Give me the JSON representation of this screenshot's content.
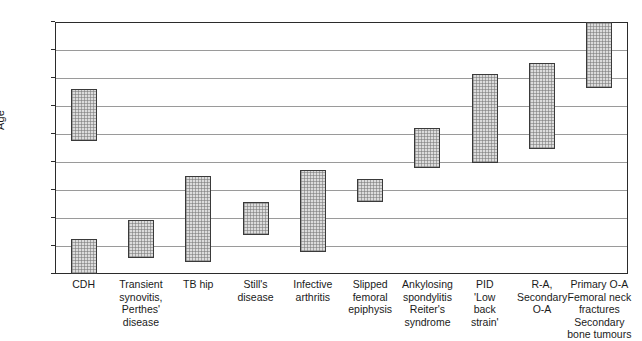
{
  "chart_data": {
    "type": "bar",
    "title": "",
    "xlabel": "",
    "ylabel": "Age",
    "ylim": [
      0,
      70
    ],
    "y_ticks": [
      0,
      5,
      10,
      15,
      20,
      30,
      40,
      50,
      60,
      70
    ],
    "grid": true,
    "legend": "none",
    "note": "Floating range bars showing typical age range of presentation for each hip condition. Y axis is non-linear: 0-20 uses 5-year steps, 20-70 uses 10-year steps, each step equal pixel height.",
    "categories": [
      "CDH",
      "Transient synovitis, Perthes' disease",
      "TB hip",
      "Still's disease",
      "Infective arthritis",
      "Slipped femoral epiphysis",
      "Ankylosing spondylitis Reiter's syndrome",
      "PID 'Low back strain'",
      "R-A, Secondary O-A",
      "Primary O-A Femoral neck fractures Secondary bone tumours"
    ],
    "category_label_lines": [
      [
        "CDH"
      ],
      [
        "Transient",
        "synovitis,",
        "Perthes'",
        "disease"
      ],
      [
        "TB hip"
      ],
      [
        "Still's",
        "disease"
      ],
      [
        "Infective",
        "arthritis"
      ],
      [
        "Slipped",
        "femoral",
        "epiphysis"
      ],
      [
        "Ankylosing",
        "spondylitis",
        "Reiter's",
        "syndrome"
      ],
      [
        "PID",
        "'Low",
        "back",
        "strain'"
      ],
      [
        "R-A,",
        "Secondary",
        "O-A"
      ],
      [
        "Primary O-A",
        "Femoral neck",
        "fractures",
        "Secondary",
        "bone tumours"
      ]
    ],
    "ranges": [
      {
        "category": "CDH",
        "bars": [
          {
            "low": 0,
            "high": 6.2
          },
          {
            "low": 27.5,
            "high": 46
          }
        ]
      },
      {
        "category": "Transient synovitis, Perthes' disease",
        "bars": [
          {
            "low": 2.8,
            "high": 9.7
          }
        ]
      },
      {
        "category": "TB hip",
        "bars": [
          {
            "low": 2.1,
            "high": 17.5
          }
        ]
      },
      {
        "category": "Still's disease",
        "bars": [
          {
            "low": 7.0,
            "high": 12.8
          }
        ]
      },
      {
        "category": "Infective arthritis",
        "bars": [
          {
            "low": 4.0,
            "high": 18.5
          }
        ]
      },
      {
        "category": "Slipped femoral epiphysis",
        "bars": [
          {
            "low": 12.8,
            "high": 17.0
          }
        ]
      },
      {
        "category": "Ankylosing spondylitis Reiter's syndrome",
        "bars": [
          {
            "low": 19.0,
            "high": 32.0
          }
        ]
      },
      {
        "category": "PID 'Low back strain'",
        "bars": [
          {
            "low": 19.8,
            "high": 51.5
          }
        ]
      },
      {
        "category": "R-A, Secondary O-A",
        "bars": [
          {
            "low": 24.5,
            "high": 55.5
          }
        ]
      },
      {
        "category": "Primary O-A Femoral neck fractures Secondary bone tumours",
        "bars": [
          {
            "low": 46.5,
            "high": 70.0
          }
        ]
      }
    ]
  },
  "colors": {
    "bar_fill": "#dcdcdc",
    "bar_border": "#3a3a3a",
    "gridline": "#9a9a9a",
    "axis": "#2b2b2b",
    "text": "#1a1a1a",
    "background": "#ffffff"
  }
}
